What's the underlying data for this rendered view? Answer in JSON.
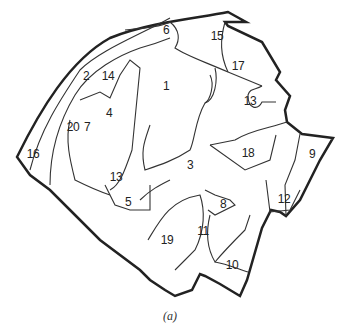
{
  "map": {
    "caption": "(a)",
    "regions": [
      {
        "id": "1",
        "x": 166,
        "y": 86
      },
      {
        "id": "2",
        "x": 86,
        "y": 76
      },
      {
        "id": "3",
        "x": 190,
        "y": 165
      },
      {
        "id": "4",
        "x": 109,
        "y": 113
      },
      {
        "id": "5",
        "x": 128,
        "y": 202
      },
      {
        "id": "6",
        "x": 166,
        "y": 30
      },
      {
        "id": "7",
        "x": 87,
        "y": 127
      },
      {
        "id": "8",
        "x": 223,
        "y": 204
      },
      {
        "id": "9",
        "x": 312,
        "y": 154
      },
      {
        "id": "10",
        "x": 232,
        "y": 265
      },
      {
        "id": "11",
        "x": 203,
        "y": 231
      },
      {
        "id": "12",
        "x": 284,
        "y": 199
      },
      {
        "id": "13a",
        "label": "13",
        "x": 250,
        "y": 101
      },
      {
        "id": "13b",
        "label": "13",
        "x": 116,
        "y": 177
      },
      {
        "id": "14",
        "x": 108,
        "y": 76
      },
      {
        "id": "15",
        "x": 217,
        "y": 36
      },
      {
        "id": "16",
        "x": 33,
        "y": 154
      },
      {
        "id": "17",
        "x": 238,
        "y": 66
      },
      {
        "id": "18",
        "x": 248,
        "y": 153
      },
      {
        "id": "19",
        "x": 167,
        "y": 240
      },
      {
        "id": "20",
        "x": 73,
        "y": 127
      }
    ]
  }
}
